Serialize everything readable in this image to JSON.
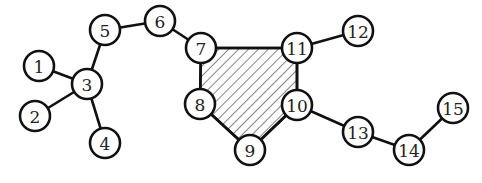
{
  "diagram": {
    "type": "graph",
    "colors": {
      "stroke": "#111111",
      "node_fill": "#ffffff",
      "hatch": "#444444",
      "background": "#ffffff"
    },
    "node_radius": 15,
    "nodes": [
      {
        "id": "1",
        "label": "1",
        "x": 39,
        "y": 66
      },
      {
        "id": "2",
        "label": "2",
        "x": 35,
        "y": 116
      },
      {
        "id": "3",
        "label": "3",
        "x": 87,
        "y": 84
      },
      {
        "id": "4",
        "label": "4",
        "x": 105,
        "y": 143
      },
      {
        "id": "5",
        "label": "5",
        "x": 105,
        "y": 30
      },
      {
        "id": "6",
        "label": "6",
        "x": 160,
        "y": 21
      },
      {
        "id": "7",
        "label": "7",
        "x": 201,
        "y": 48
      },
      {
        "id": "8",
        "label": "8",
        "x": 200,
        "y": 104
      },
      {
        "id": "9",
        "label": "9",
        "x": 250,
        "y": 150
      },
      {
        "id": "10",
        "label": "10",
        "x": 297,
        "y": 105
      },
      {
        "id": "11",
        "label": "11",
        "x": 297,
        "y": 48
      },
      {
        "id": "12",
        "label": "12",
        "x": 358,
        "y": 31
      },
      {
        "id": "13",
        "label": "13",
        "x": 358,
        "y": 132
      },
      {
        "id": "14",
        "label": "14",
        "x": 409,
        "y": 150
      },
      {
        "id": "15",
        "label": "15",
        "x": 453,
        "y": 108
      }
    ],
    "edges": [
      [
        "1",
        "3"
      ],
      [
        "2",
        "3"
      ],
      [
        "4",
        "3"
      ],
      [
        "3",
        "5"
      ],
      [
        "5",
        "6"
      ],
      [
        "6",
        "7"
      ],
      [
        "7",
        "11"
      ],
      [
        "7",
        "8"
      ],
      [
        "8",
        "9"
      ],
      [
        "9",
        "10"
      ],
      [
        "10",
        "11"
      ],
      [
        "11",
        "12"
      ],
      [
        "10",
        "13"
      ],
      [
        "13",
        "14"
      ],
      [
        "14",
        "15"
      ]
    ],
    "hatched_face": [
      "7",
      "11",
      "10",
      "9",
      "8"
    ]
  }
}
